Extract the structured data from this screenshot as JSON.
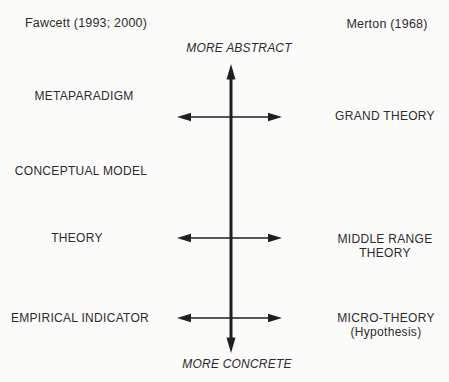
{
  "attributions": {
    "fawcett": "Fawcett (1993; 2000)",
    "merton": "Merton (1968)"
  },
  "axis": {
    "top": "MORE ABSTRACT",
    "bottom": "MORE CONCRETE"
  },
  "fawcett_levels": [
    {
      "label": "METAPARADIGM"
    },
    {
      "label": "CONCEPTUAL MODEL"
    },
    {
      "label": "THEORY"
    },
    {
      "label": "EMPIRICAL INDICATOR"
    }
  ],
  "merton_levels": [
    {
      "label": "GRAND THEORY"
    },
    {
      "label": "MIDDLE RANGE THEORY"
    },
    {
      "label": "MICRO-THEORY",
      "sublabel": "(Hypothesis)"
    }
  ],
  "icons": {
    "vertical_axis": "double-headed-vertical-arrow",
    "level_link": "double-headed-horizontal-arrow"
  },
  "colors": {
    "background": "#fbfbfa",
    "text": "#2b2b2b",
    "arrow": "#1f1f1f"
  }
}
